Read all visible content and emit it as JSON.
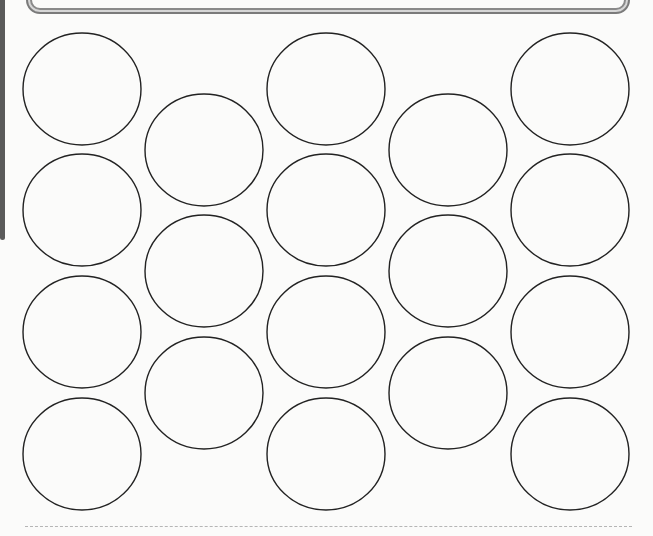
{
  "worksheet": {
    "layout": "staggered-circle-grid",
    "columns": 5,
    "circle_stroke_color": "#222222",
    "frame_color": "#7a7a7a",
    "cut_line_color": "#b5b5b5",
    "circles": [
      {
        "col": 1,
        "row": 1,
        "cx": 82,
        "cy": 89
      },
      {
        "col": 1,
        "row": 2,
        "cx": 82,
        "cy": 210
      },
      {
        "col": 1,
        "row": 3,
        "cx": 82,
        "cy": 332
      },
      {
        "col": 1,
        "row": 4,
        "cx": 82,
        "cy": 454
      },
      {
        "col": 2,
        "row": 1,
        "cx": 204,
        "cy": 150
      },
      {
        "col": 2,
        "row": 2,
        "cx": 204,
        "cy": 271
      },
      {
        "col": 2,
        "row": 3,
        "cx": 204,
        "cy": 393
      },
      {
        "col": 3,
        "row": 1,
        "cx": 326,
        "cy": 89
      },
      {
        "col": 3,
        "row": 2,
        "cx": 326,
        "cy": 210
      },
      {
        "col": 3,
        "row": 3,
        "cx": 326,
        "cy": 332
      },
      {
        "col": 3,
        "row": 4,
        "cx": 326,
        "cy": 454
      },
      {
        "col": 4,
        "row": 1,
        "cx": 448,
        "cy": 150
      },
      {
        "col": 4,
        "row": 2,
        "cx": 448,
        "cy": 271
      },
      {
        "col": 4,
        "row": 3,
        "cx": 448,
        "cy": 393
      },
      {
        "col": 5,
        "row": 1,
        "cx": 570,
        "cy": 89
      },
      {
        "col": 5,
        "row": 2,
        "cx": 570,
        "cy": 210
      },
      {
        "col": 5,
        "row": 3,
        "cx": 570,
        "cy": 332
      },
      {
        "col": 5,
        "row": 4,
        "cx": 570,
        "cy": 454
      }
    ],
    "circle_rx": 59,
    "circle_ry": 56
  }
}
